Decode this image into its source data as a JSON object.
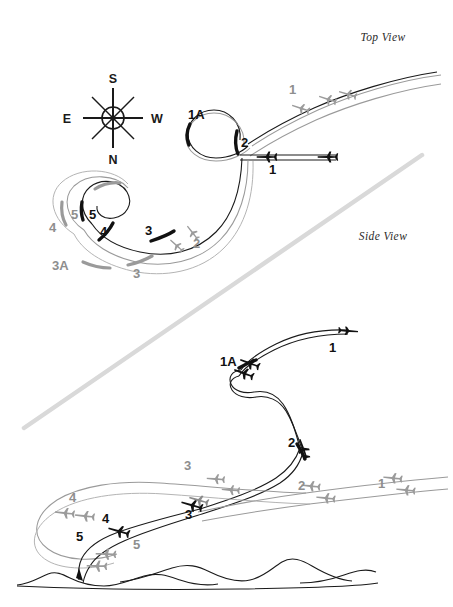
{
  "figure": {
    "title_top": "Top View",
    "title_side": "Side View",
    "background_color": "#ffffff",
    "ink_color": "#111111",
    "ghost_color": "#9a9a9a",
    "divider_color": "#d9d9d9"
  },
  "compass": {
    "name": "compass-rose",
    "orientation_note": "inverted",
    "cardinals": {
      "top": "S",
      "bottom": "N",
      "left": "E",
      "right": "W"
    }
  },
  "top_view": {
    "label": "Top View",
    "waypoints": [
      {
        "id": "tv-1-upper",
        "text": "1",
        "tone": "gray",
        "x": 289,
        "y": 94
      },
      {
        "id": "tv-1a",
        "text": "1A",
        "tone": "dark",
        "x": 188,
        "y": 119
      },
      {
        "id": "tv-2-loop",
        "text": "2",
        "tone": "dark",
        "x": 241,
        "y": 147
      },
      {
        "id": "tv-1-lower",
        "text": "1",
        "tone": "dark",
        "x": 269,
        "y": 174
      },
      {
        "id": "tv-2-curve",
        "text": "2",
        "tone": "gray",
        "x": 193,
        "y": 248
      },
      {
        "id": "tv-3-dark",
        "text": "3",
        "tone": "dark",
        "x": 145,
        "y": 235
      },
      {
        "id": "tv-3-gray",
        "text": "3",
        "tone": "gray",
        "x": 133,
        "y": 278
      },
      {
        "id": "tv-3a",
        "text": "3A",
        "tone": "gray",
        "x": 52,
        "y": 270
      },
      {
        "id": "tv-4-dark",
        "text": "4",
        "tone": "dark",
        "x": 100,
        "y": 236
      },
      {
        "id": "tv-4-gray",
        "text": "4",
        "tone": "gray",
        "x": 49,
        "y": 232
      },
      {
        "id": "tv-5-dark",
        "text": "5",
        "tone": "dark",
        "x": 89,
        "y": 219
      },
      {
        "id": "tv-5-gray",
        "text": "5",
        "tone": "gray",
        "x": 71,
        "y": 219
      }
    ]
  },
  "side_view": {
    "label": "Side View",
    "waypoints": [
      {
        "id": "sv-1-top",
        "text": "1",
        "tone": "dark",
        "x": 329,
        "y": 352
      },
      {
        "id": "sv-1a",
        "text": "1A",
        "tone": "dark",
        "x": 227,
        "y": 366
      },
      {
        "id": "sv-2-dark",
        "text": "2",
        "tone": "dark",
        "x": 288,
        "y": 447
      },
      {
        "id": "sv-1-right",
        "text": "1",
        "tone": "gray",
        "x": 378,
        "y": 488
      },
      {
        "id": "sv-2-gray",
        "text": "2",
        "tone": "gray",
        "x": 298,
        "y": 490
      },
      {
        "id": "sv-3-gray",
        "text": "3",
        "tone": "gray",
        "x": 184,
        "y": 470
      },
      {
        "id": "sv-3-dark",
        "text": "3",
        "tone": "dark",
        "x": 185,
        "y": 519
      },
      {
        "id": "sv-4-gray",
        "text": "4",
        "tone": "gray",
        "x": 69,
        "y": 502
      },
      {
        "id": "sv-4-dark",
        "text": "4",
        "tone": "dark",
        "x": 102,
        "y": 523
      },
      {
        "id": "sv-5-dark",
        "text": "5",
        "tone": "dark",
        "x": 76,
        "y": 541
      },
      {
        "id": "sv-5-gray",
        "text": "5",
        "tone": "gray",
        "x": 133,
        "y": 549
      }
    ],
    "terrain_label": "ground-profile"
  }
}
